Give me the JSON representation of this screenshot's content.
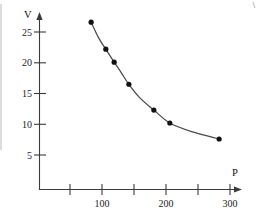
{
  "chart_data": {
    "type": "scatter",
    "title": "",
    "subtitle": "",
    "xlabel": "P",
    "ylabel": "V",
    "xlim": [
      0,
      310
    ],
    "ylim": [
      0,
      28
    ],
    "grid": false,
    "legend": null,
    "x_ticks": [
      50,
      100,
      150,
      200,
      250,
      300
    ],
    "x_tick_labels": [
      "",
      "100",
      "",
      "200",
      "",
      "300"
    ],
    "y_ticks": [
      5,
      10,
      15,
      20,
      25
    ],
    "y_tick_labels": [
      "5",
      "10",
      "15",
      "20",
      "25"
    ],
    "x": [
      83,
      106,
      119,
      142,
      181,
      206,
      283
    ],
    "y": [
      26.6,
      22.2,
      20.1,
      16.5,
      12.3,
      10.2,
      7.6
    ],
    "series": [
      {
        "name": "V vs P",
        "marker": "filled-circle",
        "marker_color": "#111111",
        "line_color": "#4a4a4a",
        "points": [
          {
            "x": 83,
            "y": 26.6
          },
          {
            "x": 106,
            "y": 22.2
          },
          {
            "x": 119,
            "y": 20.1
          },
          {
            "x": 142,
            "y": 16.5
          },
          {
            "x": 181,
            "y": 12.3
          },
          {
            "x": 206,
            "y": 10.2
          },
          {
            "x": 283,
            "y": 7.6
          }
        ]
      }
    ],
    "fitted_curve": {
      "description": "smooth decreasing hyperbola-like fit through the points",
      "points": [
        {
          "x": 83,
          "y": 26.6
        },
        {
          "x": 95,
          "y": 24.0
        },
        {
          "x": 106,
          "y": 22.2
        },
        {
          "x": 119,
          "y": 20.1
        },
        {
          "x": 130,
          "y": 18.4
        },
        {
          "x": 142,
          "y": 16.5
        },
        {
          "x": 160,
          "y": 14.2
        },
        {
          "x": 181,
          "y": 12.3
        },
        {
          "x": 206,
          "y": 10.2
        },
        {
          "x": 240,
          "y": 8.8
        },
        {
          "x": 283,
          "y": 7.6
        }
      ]
    }
  },
  "axes": {
    "y_axis_name": "V",
    "x_axis_name": "P"
  }
}
